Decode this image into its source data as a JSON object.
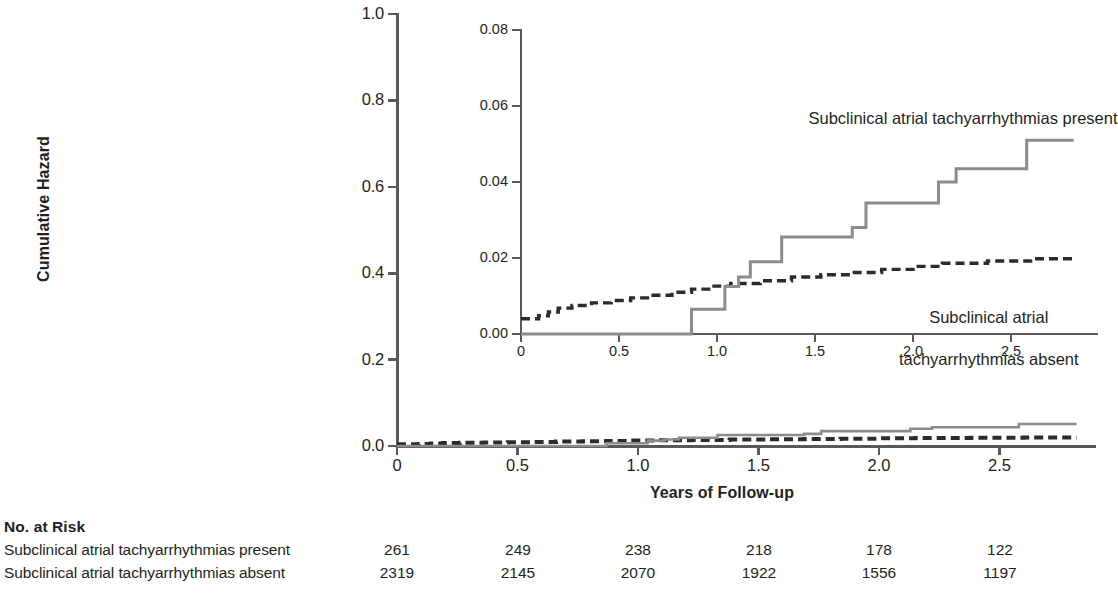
{
  "figure": {
    "y_axis_title": "Cumulative Hazard",
    "x_axis_title": "Years of Follow-up"
  },
  "annotations": {
    "present": "Subclinical atrial tachyarrhythmias present",
    "absent_line1": "Subclinical atrial",
    "absent_line2": "tachyarrhythmias absent"
  },
  "risk_table": {
    "title": "No. at Risk",
    "rows": [
      {
        "label": "Subclinical atrial tachyarrhythmias present",
        "values": [
          "261",
          "249",
          "238",
          "218",
          "178",
          "122"
        ]
      },
      {
        "label": "Subclinical atrial tachyarrhythmias absent",
        "values": [
          "2319",
          "2145",
          "2070",
          "1922",
          "1556",
          "1197"
        ]
      }
    ],
    "value_x": [
      397,
      518,
      638,
      759,
      879,
      1000
    ]
  },
  "colors": {
    "present_line": "#8c8c8c",
    "absent_line": "#2b2b2b",
    "axis": "#58595b",
    "text": "#231f20",
    "background": "#ffffff"
  },
  "chart_data": {
    "type": "line",
    "title": "",
    "xlabel": "Years of Follow-up",
    "ylabel": "Cumulative Hazard",
    "xlim": [
      0,
      2.82
    ],
    "ylim": [
      0,
      1.0
    ],
    "xticks": [
      0,
      0.5,
      1.0,
      1.5,
      2.0,
      2.5
    ],
    "xticklabels": [
      "0",
      "0.5",
      "1.0",
      "1.5",
      "2.0",
      "2.5"
    ],
    "yticks": [
      0.0,
      0.2,
      0.4,
      0.6,
      0.8,
      1.0
    ],
    "yticklabels": [
      "0.0",
      "0.2",
      "0.4",
      "0.6",
      "0.8",
      "1.0"
    ],
    "grid": false,
    "legend": "annotated-inline",
    "series": [
      {
        "name": "Subclinical atrial tachyarrhythmias present",
        "style": "solid",
        "color": "#8c8c8c",
        "steps": [
          [
            0.0,
            0.0
          ],
          [
            0.87,
            0.0
          ],
          [
            0.87,
            0.0065
          ],
          [
            1.04,
            0.0065
          ],
          [
            1.04,
            0.0125
          ],
          [
            1.11,
            0.0125
          ],
          [
            1.11,
            0.015
          ],
          [
            1.17,
            0.015
          ],
          [
            1.17,
            0.019
          ],
          [
            1.33,
            0.019
          ],
          [
            1.33,
            0.0255
          ],
          [
            1.69,
            0.0255
          ],
          [
            1.69,
            0.028
          ],
          [
            1.76,
            0.028
          ],
          [
            1.76,
            0.0345
          ],
          [
            2.13,
            0.0345
          ],
          [
            2.13,
            0.04
          ],
          [
            2.22,
            0.04
          ],
          [
            2.22,
            0.0435
          ],
          [
            2.58,
            0.0435
          ],
          [
            2.58,
            0.051
          ],
          [
            2.82,
            0.051
          ]
        ]
      },
      {
        "name": "Subclinical atrial tachyarrhythmias absent",
        "style": "dashed",
        "color": "#2b2b2b",
        "steps": [
          [
            0.0,
            0.004
          ],
          [
            0.09,
            0.004
          ],
          [
            0.09,
            0.0048
          ],
          [
            0.14,
            0.0048
          ],
          [
            0.14,
            0.0058
          ],
          [
            0.19,
            0.0058
          ],
          [
            0.19,
            0.0068
          ],
          [
            0.26,
            0.0068
          ],
          [
            0.26,
            0.0075
          ],
          [
            0.36,
            0.0075
          ],
          [
            0.36,
            0.0082
          ],
          [
            0.46,
            0.0082
          ],
          [
            0.46,
            0.0088
          ],
          [
            0.56,
            0.0088
          ],
          [
            0.56,
            0.0095
          ],
          [
            0.66,
            0.0095
          ],
          [
            0.66,
            0.0102
          ],
          [
            0.77,
            0.0102
          ],
          [
            0.77,
            0.011
          ],
          [
            0.87,
            0.011
          ],
          [
            0.87,
            0.0118
          ],
          [
            0.97,
            0.0118
          ],
          [
            0.97,
            0.0126
          ],
          [
            1.07,
            0.0126
          ],
          [
            1.07,
            0.0133
          ],
          [
            1.22,
            0.0133
          ],
          [
            1.22,
            0.014
          ],
          [
            1.38,
            0.014
          ],
          [
            1.38,
            0.015
          ],
          [
            1.53,
            0.015
          ],
          [
            1.53,
            0.0156
          ],
          [
            1.69,
            0.0156
          ],
          [
            1.69,
            0.0162
          ],
          [
            1.84,
            0.0162
          ],
          [
            1.84,
            0.017
          ],
          [
            2.0,
            0.017
          ],
          [
            2.0,
            0.0178
          ],
          [
            2.15,
            0.0178
          ],
          [
            2.15,
            0.0186
          ],
          [
            2.38,
            0.0186
          ],
          [
            2.38,
            0.0192
          ],
          [
            2.6,
            0.0192
          ],
          [
            2.6,
            0.0198
          ],
          [
            2.82,
            0.0198
          ]
        ]
      }
    ],
    "inset": {
      "type": "line",
      "xlim": [
        0,
        2.82
      ],
      "ylim": [
        0,
        0.08
      ],
      "xticks": [
        0,
        0.5,
        1.0,
        1.5,
        2.0,
        2.5
      ],
      "xticklabels": [
        "0",
        "0.5",
        "1.0",
        "1.5",
        "2.0",
        "2.5"
      ],
      "yticks": [
        0.0,
        0.02,
        0.04,
        0.06,
        0.08
      ],
      "yticklabels": [
        "0.00",
        "0.02",
        "0.04",
        "0.06",
        "0.08"
      ],
      "grid": false,
      "note": "Magnified view of the same two cumulative-hazard curves"
    }
  }
}
